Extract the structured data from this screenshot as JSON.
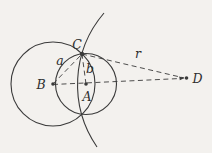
{
  "figure": {
    "colors": {
      "background": "#f3f1ee",
      "stroke": "#3a3a3a",
      "label": "#2e2e2e"
    },
    "stroke_width": 1.1,
    "dash_pattern": "5 3.5",
    "circles": [
      {
        "name": "circle-center-B",
        "cx": 53,
        "cy": 84,
        "r": 42
      },
      {
        "name": "circle-center-A",
        "cx": 86,
        "cy": 84,
        "r": 30.5
      }
    ],
    "arc": {
      "name": "large-arc-through-C",
      "path": "M 104 13 A 110 110 0 0 0 97 147"
    },
    "dashed_lines": [
      {
        "name": "segment-B-to-C",
        "x1": 53,
        "y1": 84,
        "x2": 82,
        "y2": 54
      },
      {
        "name": "segment-A-to-C",
        "x1": 86,
        "y1": 84,
        "x2": 82,
        "y2": 54
      },
      {
        "name": "segment-C-to-D",
        "x1": 82,
        "y1": 54,
        "x2": 184,
        "y2": 77.9
      },
      {
        "name": "segment-B-to-D",
        "x1": 53,
        "y1": 84.5,
        "x2": 180.5,
        "y2": 78.5
      }
    ],
    "arrowhead": {
      "name": "arrowhead-at-D",
      "points": "184.5,78.1 179.2,76.4 179.8,80.2"
    },
    "points": [
      {
        "name": "point-B",
        "x": 53,
        "y": 84,
        "r": 1.8
      },
      {
        "name": "point-A",
        "x": 86,
        "y": 84,
        "r": 1.8
      },
      {
        "name": "point-C",
        "x": 82,
        "y": 54,
        "r": 2.2
      },
      {
        "name": "point-D",
        "x": 186.5,
        "y": 78,
        "r": 1.8
      }
    ],
    "labels": [
      {
        "name": "label-C",
        "text": "C",
        "x": 77,
        "y": 49,
        "anchor": "middle",
        "size": 12.5
      },
      {
        "name": "label-a",
        "text": "a",
        "x": 60,
        "y": 65,
        "anchor": "middle",
        "size": 12.5
      },
      {
        "name": "label-b",
        "text": "b",
        "x": 90,
        "y": 73,
        "anchor": "middle",
        "size": 12.5
      },
      {
        "name": "label-r",
        "text": "r",
        "x": 138,
        "y": 58,
        "anchor": "middle",
        "size": 12.5
      },
      {
        "name": "label-B",
        "text": "B",
        "x": 41,
        "y": 89,
        "anchor": "middle",
        "size": 12.5
      },
      {
        "name": "label-A",
        "text": "A",
        "x": 87,
        "y": 101,
        "anchor": "middle",
        "size": 12.5
      },
      {
        "name": "label-D",
        "text": "D",
        "x": 192.5,
        "y": 82.5,
        "anchor": "start",
        "size": 12.5
      }
    ]
  }
}
